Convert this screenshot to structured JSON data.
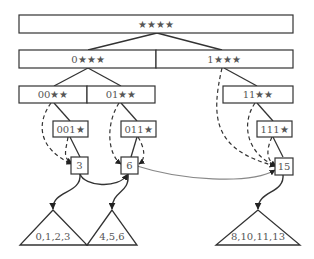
{
  "diagram": {
    "title": "",
    "trie": {
      "root": {
        "label": "★★★★"
      },
      "level1": [
        {
          "label": "0★★★"
        },
        {
          "label": "1★★★"
        }
      ],
      "level2": [
        {
          "label": "00★★"
        },
        {
          "label": "01★★"
        },
        {
          "label": "11★★"
        }
      ],
      "level3": [
        {
          "label": "001★"
        },
        {
          "label": "011★"
        },
        {
          "label": "111★"
        }
      ]
    },
    "leaves": [
      {
        "label": "3"
      },
      {
        "label": "6"
      },
      {
        "label": "15"
      }
    ],
    "subtrees": [
      {
        "label": "0,1,2,3"
      },
      {
        "label": "4,5,6"
      },
      {
        "label": "8,10,11,13"
      }
    ],
    "colors": {
      "stroke": "#333333",
      "text": "#555555",
      "link": "#888888"
    }
  }
}
